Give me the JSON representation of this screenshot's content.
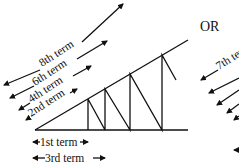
{
  "diagram": {
    "separator_label": "OR",
    "left_figure": {
      "diagonal_labels": [
        "8th term",
        "6th term",
        "4th term",
        "2nd term"
      ],
      "base_labels": [
        "1st term",
        "3rd term"
      ]
    },
    "right_figure": {
      "diagonal_labels": [
        "7th term"
      ]
    }
  }
}
